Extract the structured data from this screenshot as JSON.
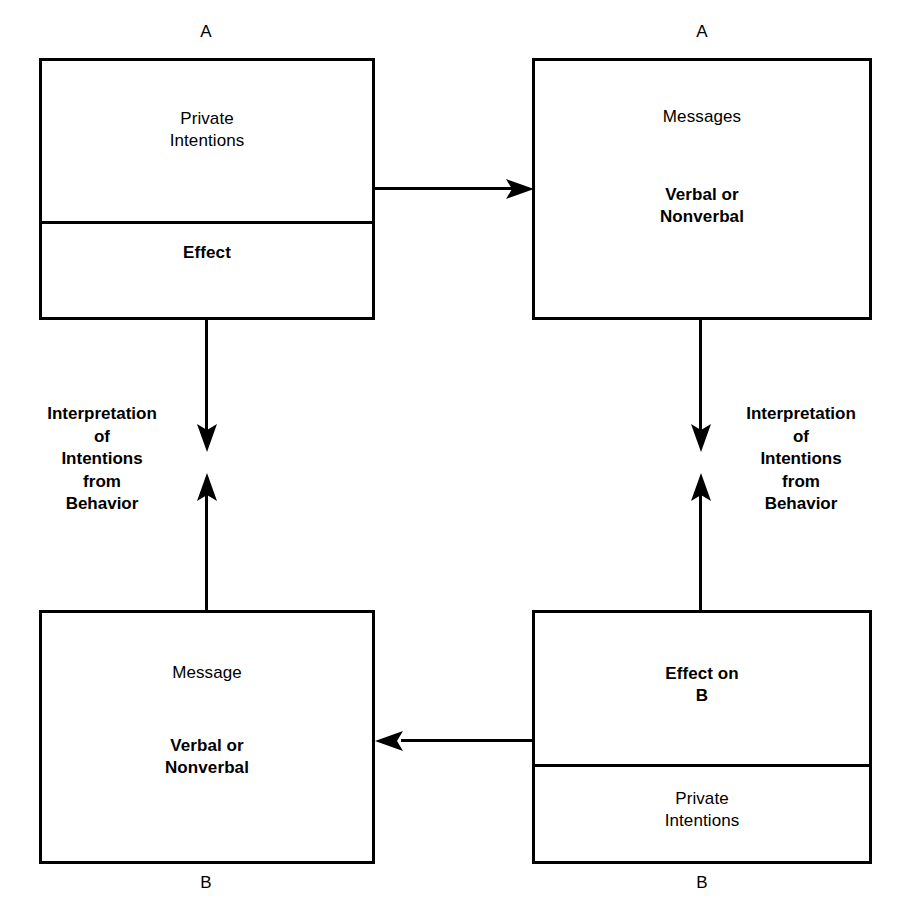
{
  "diagram": {
    "title_absent": true,
    "stroke_color": "#000000",
    "background_color": "#ffffff",
    "boxes": [
      {
        "id": "box-a-intentions",
        "top_label": "A",
        "upper_cell": {
          "text": "Private\nIntentions",
          "weight": "regular"
        },
        "lower_cell": {
          "text": "Effect",
          "weight": "bold"
        }
      },
      {
        "id": "box-a-messages",
        "top_label": "A",
        "upper_cell": {
          "text": "Messages",
          "weight": "regular"
        },
        "lower_cell": {
          "text": "Verbal or\nNonverbal",
          "weight": "bold"
        }
      },
      {
        "id": "box-b-message",
        "bottom_label": "B",
        "upper_cell": {
          "text": "Message",
          "weight": "regular"
        },
        "lower_cell": {
          "text": "Verbal or\nNonverbal",
          "weight": "bold"
        }
      },
      {
        "id": "box-b-effect",
        "bottom_label": "B",
        "upper_cell": {
          "text": "Effect on\nB",
          "weight": "bold"
        },
        "lower_cell": {
          "text": "Private\nIntentions",
          "weight": "regular"
        }
      }
    ],
    "side_labels": {
      "left": "Interpretation\nof\nIntentions\nfrom\nBehavior",
      "right": "Interpretation\nof\nIntentions\nfrom\nBehavior"
    },
    "connectors": [
      {
        "id": "arrow-top-left-to-top-right",
        "direction": "right"
      },
      {
        "id": "arrow-top-left-down",
        "direction": "down"
      },
      {
        "id": "arrow-bottom-left-up",
        "direction": "up"
      },
      {
        "id": "arrow-top-right-down",
        "direction": "down"
      },
      {
        "id": "arrow-bottom-right-up",
        "direction": "up"
      },
      {
        "id": "arrow-bottom-right-to-bottom-left",
        "direction": "left"
      }
    ]
  }
}
